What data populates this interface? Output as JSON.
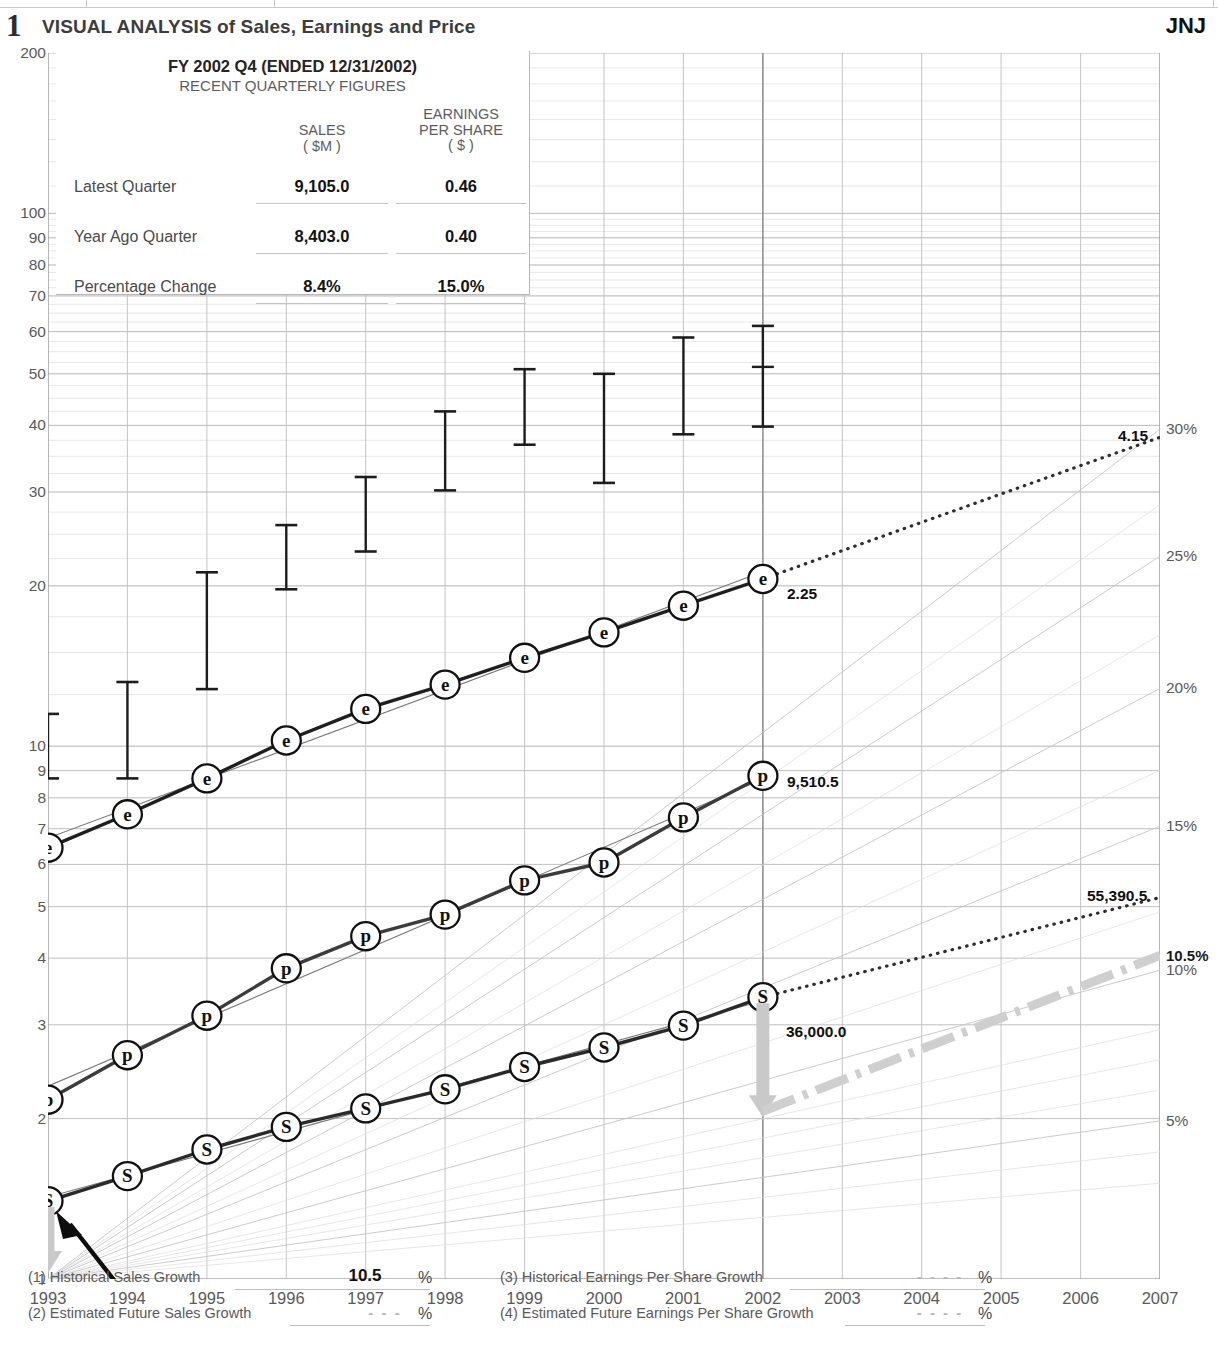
{
  "header": {
    "number": "1",
    "title": "VISUAL ANALYSIS of Sales, Earnings and Price",
    "ticker": "JNJ"
  },
  "quarterly_box": {
    "title": "FY 2002 Q4 (ENDED 12/31/2002)",
    "subtitle": "RECENT QUARTERLY FIGURES",
    "col_sales_l1": "SALES",
    "col_sales_l2": "( $M )",
    "col_eps_l1": "EARNINGS",
    "col_eps_l2": "PER SHARE",
    "col_eps_l3": "( $ )",
    "rows": [
      {
        "label": "Latest Quarter",
        "sales": "9,105.0",
        "eps": "0.46"
      },
      {
        "label": "Year Ago Quarter",
        "sales": "8,403.0",
        "eps": "0.40"
      },
      {
        "label": "Percentage Change",
        "sales": "8.4%",
        "eps": "15.0%"
      }
    ]
  },
  "footer": {
    "line1_label": "(1) Historical Sales Growth",
    "line1_value": "10.5",
    "line1_pct": "%",
    "line2_label": "(2) Estimated Future Sales Growth",
    "line2_value": "- - -",
    "line2_pct": "%",
    "line3_label": "(3) Historical Earnings Per Share Growth",
    "line3_value": "- - - -",
    "line3_pct": "%",
    "line4_label": "(4) Estimated Future Earnings Per Share Growth",
    "line4_value": "- - - -",
    "line4_pct": "%"
  },
  "chart_data": {
    "type": "line",
    "title": "VISUAL ANALYSIS of Sales, Earnings and Price",
    "xlabel": "",
    "ylabel": "",
    "yscale": "log",
    "ylim": [
      1,
      200
    ],
    "grid": true,
    "legend": "none",
    "x": [
      1993,
      1994,
      1995,
      1996,
      1997,
      1998,
      1999,
      2000,
      2001,
      2002,
      2003,
      2004,
      2005,
      2006,
      2007
    ],
    "ytick_labels": [
      "1",
      "2",
      "3",
      "4",
      "5",
      "6",
      "7",
      "8",
      "9",
      "10",
      "20",
      "30",
      "40",
      "50",
      "60",
      "70",
      "80",
      "90",
      "100",
      "200"
    ],
    "right_axis_label": "Annual growth rate reference lines",
    "right_ticks": [
      "5%",
      "10%",
      "10.5%",
      "15%",
      "20%",
      "25%",
      "30%"
    ],
    "right_ticks_bold": [
      "10.5%"
    ],
    "projection_year": 2002,
    "series": [
      {
        "name": "Sales ($M, scaled)",
        "symbol": "S",
        "x": [
          1993,
          1994,
          1995,
          1996,
          1997,
          1998,
          1999,
          2000,
          2001,
          2002
        ],
        "values": [
          1.4,
          1.56,
          1.75,
          1.93,
          2.09,
          2.27,
          2.5,
          2.72,
          2.99,
          3.38
        ],
        "label_2002": "36,000.0",
        "projected_2007_label": "55,390.5",
        "projected_2007_value": 5.2
      },
      {
        "name": "Pre-tax Profit ($M, scaled)",
        "symbol": "p",
        "x": [
          1993,
          1994,
          1995,
          1996,
          1997,
          1998,
          1999,
          2000,
          2001,
          2002
        ],
        "values": [
          2.17,
          2.63,
          3.12,
          3.83,
          4.4,
          4.83,
          5.6,
          6.05,
          7.35,
          8.8
        ],
        "label_2002": "9,510.5"
      },
      {
        "name": "Earnings Per Share ($, scaled)",
        "symbol": "e",
        "x": [
          1993,
          1994,
          1995,
          1996,
          1997,
          1998,
          1999,
          2000,
          2001,
          2002
        ],
        "values": [
          6.45,
          7.45,
          8.7,
          10.25,
          11.75,
          13.05,
          14.65,
          16.35,
          18.35,
          20.6
        ],
        "label_2002": "2.25",
        "projected_2007_label": "4.15",
        "projected_2007_value": 38.0
      }
    ],
    "price_bars": {
      "name": "Annual Price Range (High/Low)",
      "x": [
        1993,
        1994,
        1995,
        1996,
        1997,
        1998,
        1999,
        2000,
        2001,
        2002
      ],
      "high": [
        11.5,
        13.2,
        21.2,
        26.0,
        32.0,
        42.5,
        51.0,
        50.0,
        58.5,
        61.5
      ],
      "low": [
        8.7,
        8.7,
        12.8,
        19.7,
        23.2,
        30.2,
        36.8,
        31.2,
        38.5,
        39.8
      ],
      "close": [
        null,
        null,
        null,
        null,
        null,
        null,
        null,
        null,
        null,
        51.5
      ]
    },
    "annotations": [
      {
        "text": "2.25",
        "series": "e",
        "at_year": 2002
      },
      {
        "text": "4.15",
        "series": "e",
        "at_year": 2007
      },
      {
        "text": "9,510.5",
        "series": "p",
        "at_year": 2002
      },
      {
        "text": "36,000.0",
        "series": "S",
        "at_year": 2002
      },
      {
        "text": "55,390.5",
        "series": "S",
        "at_year": 2007
      }
    ]
  }
}
